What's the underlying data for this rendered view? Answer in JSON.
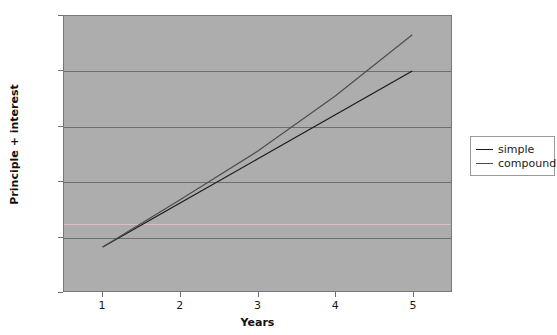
{
  "chart_data": {
    "type": "line",
    "title": "",
    "xlabel": "Years",
    "ylabel": "Principle + interest",
    "x": [
      1,
      2,
      3,
      4,
      5
    ],
    "xlim": [
      0.5,
      5.5
    ],
    "ylim": [
      100,
      150
    ],
    "xticks": [
      "1",
      "2",
      "3",
      "4",
      "5"
    ],
    "yticks": [
      "100",
      "110",
      "120",
      "130",
      "140",
      "150"
    ],
    "grid": "horizontal",
    "legend_position": "right",
    "plot_background": "#adadad",
    "page_background": "#ffffff",
    "series": [
      {
        "name": "simple",
        "color": "#1a1a1a",
        "values": [
          108,
          116,
          124,
          132,
          140
        ]
      },
      {
        "name": "compound",
        "color": "#4d4d4d",
        "values": [
          108,
          116.6,
          125.4,
          135.4,
          146.6
        ]
      }
    ],
    "reference_lines": [
      {
        "name": "pink-reference-line",
        "orientation": "horizontal",
        "value": 112.5,
        "color": "#e8b9c4"
      }
    ]
  }
}
